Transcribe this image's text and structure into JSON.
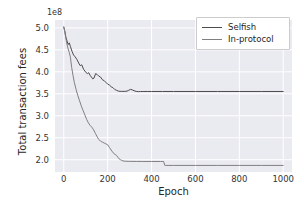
{
  "chart_data": {
    "type": "line",
    "title": "",
    "xlabel": "Epoch",
    "ylabel": "Total transaction fees",
    "y_offset_text": "1e8",
    "xlim": [
      -40,
      1040
    ],
    "ylim": [
      1.72,
      5.18
    ],
    "xticks": [
      0,
      200,
      400,
      600,
      800,
      1000
    ],
    "xticklabels": [
      "0",
      "200",
      "400",
      "600",
      "800",
      "1000"
    ],
    "yticks": [
      2.0,
      2.5,
      3.0,
      3.5,
      4.0,
      4.5,
      5.0
    ],
    "yticklabels": [
      "2.0",
      "2.5",
      "3.0",
      "3.5",
      "4.0",
      "4.5",
      "5.0"
    ],
    "grid": true,
    "grid_color": "#ffffff",
    "axes_bg": "#eaeaf1",
    "legend_position": "upper right",
    "legend_entries": [
      "Selfish",
      "In-protocol"
    ],
    "series": [
      {
        "name": "Selfish",
        "color": "#4c4c4c",
        "linewidth": 1.0,
        "x": [
          0,
          5,
          10,
          15,
          20,
          25,
          30,
          38,
          45,
          52,
          60,
          68,
          75,
          82,
          90,
          96,
          102,
          108,
          114,
          120,
          126,
          132,
          138,
          145,
          152,
          160,
          168,
          176,
          184,
          192,
          200,
          208,
          216,
          224,
          232,
          240,
          250,
          262,
          275,
          288,
          296,
          304,
          312,
          320,
          330,
          340,
          350,
          365,
          380,
          400,
          450,
          500,
          600,
          700,
          800,
          900,
          1000
        ],
        "y": [
          5.02,
          4.92,
          4.78,
          4.7,
          4.62,
          4.66,
          4.58,
          4.46,
          4.38,
          4.34,
          4.28,
          4.2,
          4.14,
          4.16,
          4.06,
          4.02,
          3.98,
          3.96,
          3.98,
          3.92,
          3.88,
          3.84,
          3.86,
          3.96,
          3.94,
          3.9,
          3.88,
          3.82,
          3.8,
          3.76,
          3.72,
          3.7,
          3.66,
          3.64,
          3.6,
          3.58,
          3.56,
          3.555,
          3.555,
          3.56,
          3.58,
          3.6,
          3.59,
          3.57,
          3.555,
          3.55,
          3.552,
          3.553,
          3.553,
          3.553,
          3.553,
          3.553,
          3.553,
          3.553,
          3.553,
          3.553,
          3.553
        ]
      },
      {
        "name": "In-protocol",
        "color": "#808080",
        "linewidth": 1.0,
        "x": [
          0,
          5,
          10,
          15,
          20,
          25,
          30,
          36,
          42,
          48,
          56,
          64,
          72,
          80,
          88,
          96,
          104,
          112,
          120,
          128,
          136,
          144,
          152,
          160,
          168,
          176,
          184,
          192,
          200,
          208,
          216,
          222,
          228,
          234,
          240,
          246,
          252,
          258,
          264,
          270,
          280,
          300,
          330,
          360,
          400,
          440,
          455,
          460,
          465,
          500,
          600,
          700,
          800,
          900,
          1000
        ],
        "y": [
          5.02,
          4.9,
          4.74,
          4.62,
          4.52,
          4.44,
          4.34,
          4.1,
          3.92,
          3.76,
          3.6,
          3.46,
          3.34,
          3.22,
          3.12,
          3.02,
          2.92,
          2.84,
          2.78,
          2.74,
          2.68,
          2.6,
          2.52,
          2.46,
          2.42,
          2.4,
          2.38,
          2.36,
          2.34,
          2.28,
          2.22,
          2.18,
          2.14,
          2.12,
          2.1,
          2.06,
          2.02,
          2.0,
          1.985,
          1.972,
          1.965,
          1.962,
          1.961,
          1.96,
          1.96,
          1.96,
          1.96,
          1.872,
          1.87,
          1.87,
          1.87,
          1.87,
          1.87,
          1.87,
          1.87
        ]
      }
    ]
  }
}
